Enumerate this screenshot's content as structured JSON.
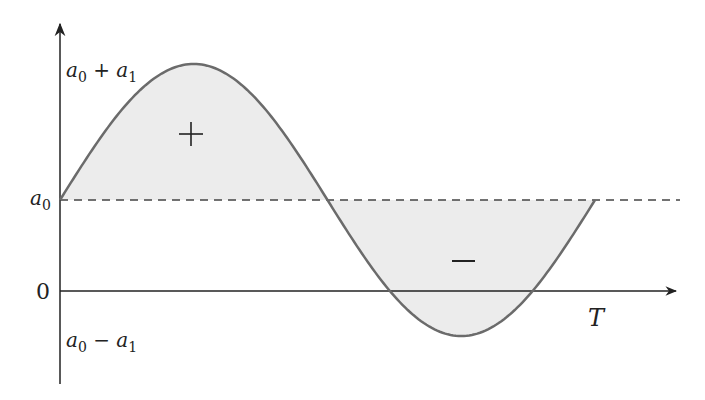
{
  "diagram": {
    "type": "sinusoid-about-offset",
    "axes": {
      "y_labels": {
        "top": {
          "base": "a",
          "sub0": "0",
          "op": " + ",
          "base2": "a",
          "sub1": "1"
        },
        "mid": {
          "base": "a",
          "sub0": "0"
        },
        "zero": "0",
        "bottom": {
          "base": "a",
          "sub0": "0",
          "op": " − ",
          "base2": "a",
          "sub1": "1"
        }
      },
      "x_label": "T"
    },
    "regions": {
      "positive_sign": "+",
      "negative_sign": "−"
    },
    "colors": {
      "curve": "#6b6b6b",
      "fill": "#ececec",
      "axis": "#222222",
      "dashed": "#444444"
    }
  }
}
